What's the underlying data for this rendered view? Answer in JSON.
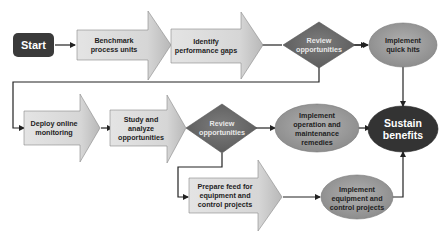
{
  "diagram": {
    "type": "flowchart",
    "colors": {
      "start_fill": "#3a3a3a",
      "arrow_fill": "#d9d9d9",
      "decision_fill": "#6e6e6e",
      "process_oval_fill": "#9a9a9a",
      "terminal_oval_fill": "#333333",
      "connector": "#222222"
    },
    "nodes": {
      "start": {
        "label": "Start",
        "shape": "rounded-rect"
      },
      "benchmark": {
        "label": "Benchmark process units",
        "shape": "block-arrow"
      },
      "identify": {
        "label": "Identify performance gaps",
        "shape": "block-arrow"
      },
      "review1": {
        "label": "Review opportunities",
        "shape": "diamond"
      },
      "quick_hits": {
        "label": "Implement quick hits",
        "shape": "oval"
      },
      "deploy": {
        "label": "Deploy online monitoring",
        "shape": "block-arrow"
      },
      "study": {
        "label": "Study and analyze opportunities",
        "shape": "block-arrow"
      },
      "review2": {
        "label": "Review opportunities",
        "shape": "diamond"
      },
      "om_remedies": {
        "label": "Implement operation and maintenance remedies",
        "shape": "oval"
      },
      "sustain": {
        "label": "Sustain benefits",
        "shape": "oval"
      },
      "prepare": {
        "label": "Prepare feed for equipment and control projects",
        "shape": "block-arrow"
      },
      "equip_projects": {
        "label": "Implement equipment and control projects",
        "shape": "oval"
      }
    },
    "edges": [
      {
        "from": "start",
        "to": "benchmark"
      },
      {
        "from": "benchmark",
        "to": "identify"
      },
      {
        "from": "identify",
        "to": "review1"
      },
      {
        "from": "review1",
        "to": "quick_hits"
      },
      {
        "from": "review1",
        "to": "deploy"
      },
      {
        "from": "quick_hits",
        "to": "sustain"
      },
      {
        "from": "deploy",
        "to": "study"
      },
      {
        "from": "study",
        "to": "review2"
      },
      {
        "from": "review2",
        "to": "om_remedies"
      },
      {
        "from": "review2",
        "to": "prepare"
      },
      {
        "from": "om_remedies",
        "to": "sustain"
      },
      {
        "from": "prepare",
        "to": "equip_projects"
      },
      {
        "from": "equip_projects",
        "to": "sustain"
      }
    ]
  }
}
